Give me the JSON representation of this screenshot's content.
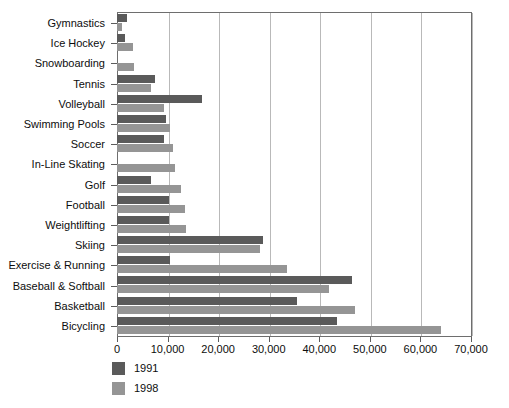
{
  "chart_data": {
    "type": "bar",
    "orientation": "horizontal",
    "title": "",
    "xlabel": "",
    "ylabel": "",
    "xlim": [
      0,
      70000
    ],
    "xticks": [
      0,
      10000,
      20000,
      30000,
      40000,
      50000,
      60000,
      70000
    ],
    "xticklabels": [
      "0",
      "10,000",
      "20,000",
      "30,000",
      "40,000",
      "50,000",
      "60,000",
      "70,000"
    ],
    "grid": true,
    "grid_axis": "x",
    "legend_position": "below-left",
    "categories": [
      "Gymnastics",
      "Ice Hockey",
      "Snowboarding",
      "Tennis",
      "Volleyball",
      "Swimming Pools",
      "Soccer",
      "In-Line Skating",
      "Golf",
      "Football",
      "Weightlifting",
      "Skiing",
      "Exercise & Running",
      "Baseball & Softball",
      "Basketball",
      "Bicycling"
    ],
    "series": [
      {
        "name": "1991",
        "color": "#5a5a5a",
        "values": [
          2000,
          1600,
          0,
          7500,
          16800,
          9700,
          9300,
          0,
          6700,
          10300,
          10300,
          28800,
          10500,
          46500,
          35500,
          43500
        ]
      },
      {
        "name": "1998",
        "color": "#959595",
        "values": [
          1000,
          3200,
          3400,
          6800,
          9300,
          10500,
          11000,
          11400,
          12700,
          13400,
          13700,
          28300,
          33700,
          42000,
          47000,
          64000
        ]
      }
    ]
  },
  "legend": {
    "entries": [
      {
        "label": "1991",
        "color": "#5a5a5a"
      },
      {
        "label": "1998",
        "color": "#959595"
      }
    ]
  },
  "top_cropped_text": ""
}
